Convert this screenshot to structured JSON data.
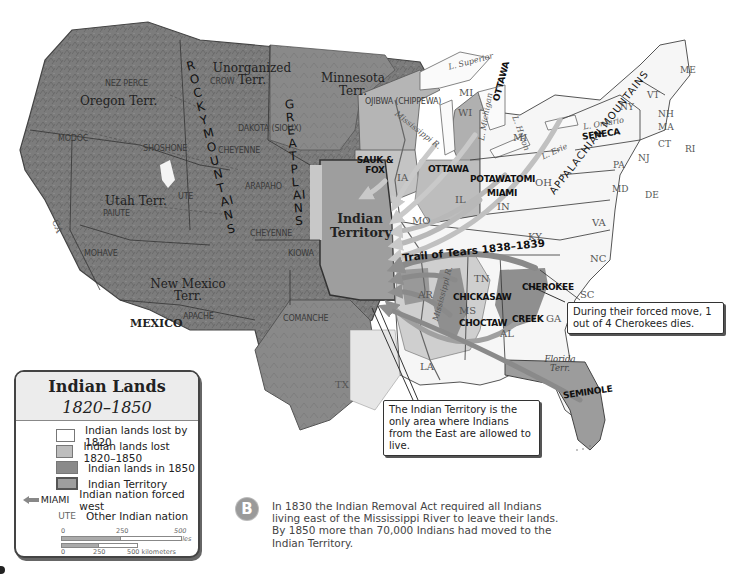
{
  "legend": {
    "title": "Indian Lands",
    "years": "1820–1850",
    "items": [
      {
        "label": "Indian lands lost by 1820",
        "color": "#ffffff"
      },
      {
        "label": "Indian lands lost 1820–1850",
        "color": "#bdbdbd"
      },
      {
        "label": "Indian lands in 1850",
        "color": "#8a8a8a"
      },
      {
        "label": "Indian Territory",
        "color": "#9e9e9e"
      }
    ],
    "forced_icon_label": "MIAMI",
    "forced_label": "Indian nation forced west",
    "other_icon_label": "UTE",
    "other_label": "Other Indian nation",
    "scale_miles": {
      "t0": "0",
      "t1": "250",
      "t2": "500 miles"
    },
    "scale_km": {
      "t0": "0",
      "t1": "250",
      "t2": "500 kilometers"
    }
  },
  "map": {
    "territories": {
      "oregon": "Oregon Terr.",
      "unorganized": "Unorganized Terr.",
      "minnesota": "Minnesota Terr.",
      "utah": "Utah Terr.",
      "new_mexico": "New Mexico Terr.",
      "indian_territory": "Indian Territory",
      "florida": "Florida Terr.",
      "mexico": "MEXICO"
    },
    "ranges": {
      "rocky": "ROCKY MOUNTAINS",
      "great_plains": "GREAT PLAINS",
      "appalachian": "APPALACHIAN MOUNTAINS"
    },
    "other_nations": [
      "NEZ PERCE",
      "CROW",
      "MODOC",
      "SHOSHONE",
      "DAKOTA (SIOUX)",
      "CHEYENNE",
      "UTE",
      "PAIUTE",
      "ARAPAHO",
      "CHEYENNE",
      "KIOWA",
      "MOHAVE",
      "APACHE",
      "COMANCHE",
      "OJIBWA (CHIPPEWA)"
    ],
    "forced_nations": [
      "SAUK & FOX",
      "OTTAWA",
      "OTTAWA",
      "POTAWATOMI",
      "MIAMI",
      "SENECA",
      "CHICKASAW",
      "CHEROKEE",
      "CHOCTAW",
      "CREEK",
      "SEMINOLE"
    ],
    "states": [
      "WI",
      "MI",
      "MI",
      "IA",
      "IL",
      "IN",
      "OH",
      "MO",
      "KY",
      "TN",
      "AR",
      "MS",
      "AL",
      "GA",
      "LA",
      "TX",
      "SC",
      "NC",
      "VA",
      "MD",
      "DE",
      "PA",
      "NJ",
      "NY",
      "CT",
      "RI",
      "MA",
      "VT",
      "NH",
      "ME",
      "CA"
    ],
    "water": {
      "superior": "L. Superior",
      "michigan": "L. Michigan",
      "huron": "L. Huron",
      "erie": "L. Erie",
      "ontario": "L. Ontario",
      "mississippi_north": "Mississippi R.",
      "mississippi_south": "Mississippi R."
    },
    "trail_of_tears": "Trail of Tears 1838–1839"
  },
  "callouts": {
    "cherokee": "During their forced move, 1 out of 4 Cherokees dies.",
    "territory": "The Indian Territory is the only area where Indians from the East are allowed to live."
  },
  "note": {
    "badge": "B",
    "text": "In 1830 the Indian Removal Act required all Indians living east of the Mississippi River to leave their lands. By 1850 more than 70,000 Indians had moved to the Indian Territory."
  },
  "colors": {
    "lost_by_1820": "#ffffff",
    "lost_1820_1850": "#bdbdbd",
    "lands_1850": "#8a8a8a",
    "indian_territory": "#9e9e9e",
    "arrow": "#8f8f8f"
  }
}
